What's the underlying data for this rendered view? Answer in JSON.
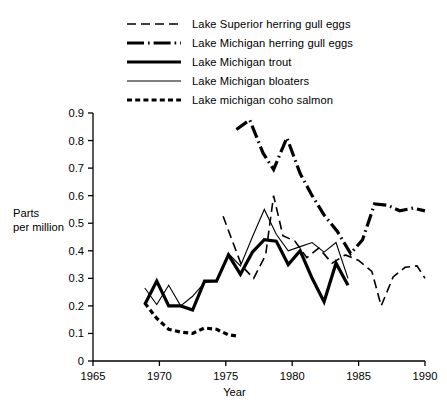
{
  "chart_data": {
    "type": "line",
    "title": "",
    "xlabel": "Year",
    "ylabel": "Parts per million",
    "ylabel_line1": "Parts",
    "ylabel_line2": "per million",
    "xlim": [
      1965,
      1990
    ],
    "ylim": [
      0,
      0.9
    ],
    "xticks": [
      1965,
      1970,
      1975,
      1980,
      1985,
      1990
    ],
    "yticks": [
      "0",
      "0.1",
      "0.2",
      "0.3",
      "0.4",
      "0.5",
      "0.6",
      "0.7",
      "0.8",
      "0.9"
    ],
    "ytick_values": [
      0,
      0.1,
      0.2,
      0.3,
      0.4,
      0.5,
      0.6,
      0.7,
      0.8,
      0.9
    ],
    "grid": false,
    "legend_position": "top-center",
    "series": [
      {
        "name": "Lake Superior herring gull eggs",
        "style": "long-dash",
        "width": 1.6,
        "color": "#000000",
        "x": [
          1974.8,
          1976.2,
          1977.1,
          1978.0,
          1978.6,
          1979.3,
          1980.2,
          1981.1,
          1982.0,
          1983.0,
          1984.0,
          1985.0,
          1986.0,
          1986.7,
          1987.6,
          1988.5,
          1989.4,
          1990.0
        ],
        "y": [
          0.525,
          0.345,
          0.3,
          0.385,
          0.6,
          0.455,
          0.435,
          0.375,
          0.41,
          0.355,
          0.385,
          0.365,
          0.325,
          0.2,
          0.305,
          0.34,
          0.345,
          0.3
        ]
      },
      {
        "name": "Lake Michigan herring gull eggs",
        "style": "dash-dot",
        "width": 3.2,
        "color": "#000000",
        "x": [
          1975.8,
          1976.8,
          1977.8,
          1978.6,
          1979.6,
          1980.6,
          1981.5,
          1982.4,
          1983.4,
          1984.4,
          1985.3,
          1986.2,
          1987.2,
          1988.1,
          1989.1,
          1990.0
        ],
        "y": [
          0.84,
          0.875,
          0.755,
          0.695,
          0.81,
          0.68,
          0.6,
          0.53,
          0.47,
          0.39,
          0.44,
          0.57,
          0.565,
          0.545,
          0.555,
          0.545
        ]
      },
      {
        "name": "Lake Michigan trout",
        "style": "solid",
        "width": 3.2,
        "color": "#000000",
        "x": [
          1968.9,
          1969.8,
          1970.7,
          1971.6,
          1972.5,
          1973.4,
          1974.3,
          1975.2,
          1976.1,
          1977.0,
          1977.9,
          1978.8,
          1979.7,
          1980.6,
          1981.5,
          1982.4,
          1983.3,
          1984.2
        ],
        "y": [
          0.205,
          0.29,
          0.2,
          0.2,
          0.185,
          0.29,
          0.29,
          0.385,
          0.315,
          0.395,
          0.44,
          0.435,
          0.35,
          0.4,
          0.3,
          0.215,
          0.355,
          0.275
        ]
      },
      {
        "name": "Lake Michigan bloaters",
        "style": "thin-solid",
        "width": 1.1,
        "color": "#000000",
        "x": [
          1968.9,
          1969.8,
          1970.7,
          1971.6,
          1972.5,
          1973.4,
          1974.3,
          1975.2,
          1976.1,
          1977.0,
          1977.9,
          1978.8,
          1979.7,
          1980.6,
          1981.5,
          1982.4,
          1983.3,
          1984.2
        ],
        "y": [
          0.265,
          0.205,
          0.275,
          0.2,
          0.235,
          0.285,
          0.29,
          0.39,
          0.345,
          0.45,
          0.55,
          0.46,
          0.4,
          0.415,
          0.43,
          0.395,
          0.43,
          0.3
        ]
      },
      {
        "name": "Lake michigan coho salmon",
        "style": "short-dash",
        "width": 3.2,
        "color": "#000000",
        "x": [
          1968.9,
          1969.8,
          1970.7,
          1971.6,
          1972.5,
          1973.4,
          1974.3,
          1975.2,
          1975.9
        ],
        "y": [
          0.21,
          0.155,
          0.115,
          0.105,
          0.1,
          0.12,
          0.115,
          0.095,
          0.09
        ]
      }
    ]
  },
  "legend": {
    "items": [
      {
        "label": "Lake Superior herring gull eggs",
        "style": "long-dash"
      },
      {
        "label": "Lake Michigan herring gull eggs",
        "style": "dash-dot"
      },
      {
        "label": "Lake Michigan trout",
        "style": "solid"
      },
      {
        "label": "Lake Michigan bloaters",
        "style": "thin-solid"
      },
      {
        "label": "Lake michigan coho salmon",
        "style": "short-dash"
      }
    ]
  },
  "axes": {
    "y_label_line1": "Parts",
    "y_label_line2": "per million",
    "x_label": "Year"
  }
}
